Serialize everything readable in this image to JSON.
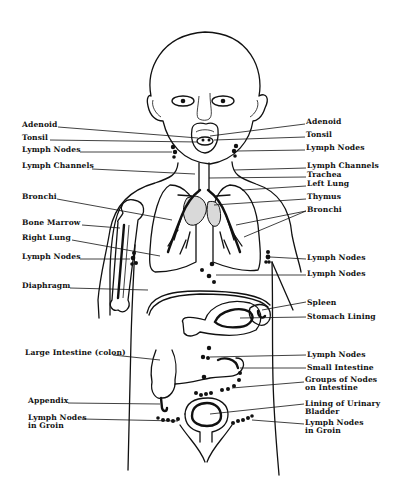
{
  "diagram": {
    "left_labels": [
      {
        "id": "adenoid-left",
        "text": "Adenoid",
        "x": 22,
        "y": 124
      },
      {
        "id": "tonsil-left",
        "text": "Tonsil",
        "x": 22,
        "y": 137
      },
      {
        "id": "lymph-nodes-neck-left",
        "text": "Lymph Nodes",
        "x": 22,
        "y": 149
      },
      {
        "id": "lymph-channels-left",
        "text": "Lymph Channels",
        "x": 22,
        "y": 165
      },
      {
        "id": "bronchi-left",
        "text": "Bronchi",
        "x": 22,
        "y": 196
      },
      {
        "id": "bone-marrow",
        "text": "Bone Marrow",
        "x": 22,
        "y": 222
      },
      {
        "id": "right-lung",
        "text": "Right Lung",
        "x": 22,
        "y": 237
      },
      {
        "id": "lymph-nodes-armpit-left",
        "text": "Lymph Nodes",
        "x": 22,
        "y": 256
      },
      {
        "id": "diaphragm",
        "text": "Diaphragm",
        "x": 22,
        "y": 285
      },
      {
        "id": "large-intestine",
        "text": "Large Intestine (colon)",
        "x": 25,
        "y": 352
      },
      {
        "id": "appendix",
        "text": "Appendix",
        "x": 28,
        "y": 400
      },
      {
        "id": "lymph-nodes-groin-left",
        "text": "Lymph Nodes\nin Groin",
        "x": 28,
        "y": 416
      }
    ],
    "right_labels": [
      {
        "id": "adenoid-right",
        "text": "Adenoid",
        "x": 306,
        "y": 121
      },
      {
        "id": "tonsil-right",
        "text": "Tonsil",
        "x": 306,
        "y": 134
      },
      {
        "id": "lymph-nodes-neck-right",
        "text": "Lymph Nodes",
        "x": 306,
        "y": 146
      },
      {
        "id": "lymph-channels-right",
        "text": "Lymph Channels",
        "x": 307,
        "y": 165
      },
      {
        "id": "trachea",
        "text": "Trachea",
        "x": 307,
        "y": 174
      },
      {
        "id": "left-lung",
        "text": "Left Lung",
        "x": 307,
        "y": 183
      },
      {
        "id": "thymus",
        "text": "Thymus",
        "x": 307,
        "y": 196
      },
      {
        "id": "bronchi-right",
        "text": "Bronchi",
        "x": 307,
        "y": 209
      },
      {
        "id": "lymph-nodes-armpit-right",
        "text": "Lymph Nodes",
        "x": 307,
        "y": 256
      },
      {
        "id": "lymph-nodes-abdomen-right",
        "text": "Lymph Nodes",
        "x": 307,
        "y": 272
      },
      {
        "id": "spleen",
        "text": "Spleen",
        "x": 307,
        "y": 300
      },
      {
        "id": "stomach-lining",
        "text": "Stomach Lining",
        "x": 307,
        "y": 314
      },
      {
        "id": "lymph-nodes-intestine-right",
        "text": "Lymph Nodes",
        "x": 307,
        "y": 352
      },
      {
        "id": "small-intestine",
        "text": "Small Intestine",
        "x": 307,
        "y": 365
      },
      {
        "id": "groups-of-nodes",
        "text": "Groups of Nodes\non Intestine",
        "x": 305,
        "y": 377
      },
      {
        "id": "bladder-lining",
        "text": "Lining of Urinary\nBladder",
        "x": 305,
        "y": 401
      },
      {
        "id": "lymph-nodes-groin-right",
        "text": "Lymph Nodes\nin Groin",
        "x": 305,
        "y": 420
      }
    ]
  }
}
